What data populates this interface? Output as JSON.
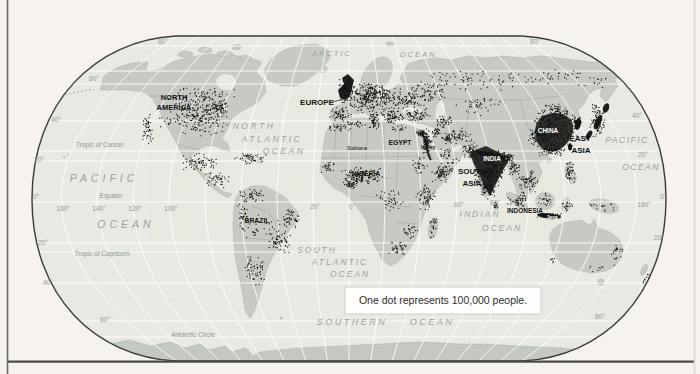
{
  "figure": {
    "legend_text": "One dot represents 100,000 people.",
    "colors": {
      "page_background": "#f6f2ef",
      "ocean": "#e7e9e2",
      "land": "#c7cbc2",
      "dots": "#161616",
      "outline": "#3c3c3a",
      "graticule": "#ffffff"
    },
    "region_labels": {
      "north": "NORTH",
      "america": "AMERICA",
      "europe": "EUROPE",
      "asia_ghost": "ASIA",
      "egypt": "EGYPT",
      "nile1": "Nile",
      "nile2": "Valley",
      "sahara": "Sahara",
      "nigeria": "NIGERIA",
      "brazil": "BRAZIL",
      "south": "SOUTH",
      "asia": "ASIA",
      "india": "INDIA",
      "china": "CHINA",
      "east": "EAST",
      "indonesia": "INDONESIA",
      "java": "Java"
    },
    "ocean_labels": {
      "arctic": "ARCTIC",
      "ocean": "OCEAN",
      "north": "NORTH",
      "atlantic": "ATLANTIC",
      "pacific": "PACIFIC",
      "south": "SOUTH",
      "indian": "INDIAN",
      "southern": "SOUTHERN"
    },
    "line_labels": {
      "tropic_of_cancer": "Tropic of Cancer",
      "equator": "Equator",
      "tropic_of_capricorn": "Tropic of Capricorn",
      "antarctic_circle": "Antarctic Circle"
    },
    "ticks": {
      "d0": "0°",
      "d20": "20°",
      "d40": "40°",
      "d60": "60°",
      "d80": "80°",
      "d100": "100°",
      "d120": "120°",
      "d140": "140°",
      "d160": "160°"
    }
  }
}
